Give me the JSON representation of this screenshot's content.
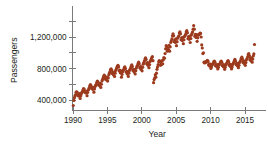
{
  "chart_data": {
    "type": "scatter",
    "title": "",
    "xlabel": "Year",
    "ylabel": "Passengers",
    "xlim": [
      1989.2,
      2016.8
    ],
    "ylim": [
      300000,
      1450000
    ],
    "grid": false,
    "legend": null,
    "marker": {
      "color": "#9c3a1d",
      "shape": "circle",
      "size_px": 2.1
    },
    "axis_color": "#7a7a7a",
    "text_color": "#231f20",
    "background": "#ffffff",
    "xticks": [
      1990,
      1995,
      2000,
      2005,
      2010,
      2015
    ],
    "xtick_labels": [
      "1990",
      "1995",
      "2000",
      "2005",
      "2010",
      "2015"
    ],
    "yticks": [
      400000,
      600000,
      800000,
      1000000,
      1200000,
      1400000
    ],
    "ytick_labels": [
      "400,000",
      "",
      "800,000",
      "",
      "1,200,000",
      ""
    ],
    "ytick_labeled": [
      400000,
      800000,
      1200000
    ],
    "ytick_minor": [
      600000,
      1000000,
      1400000
    ],
    "series": [
      {
        "name": "Monthly passengers",
        "x": [
          1990.04,
          1990.13,
          1990.21,
          1990.29,
          1990.38,
          1990.46,
          1990.54,
          1990.63,
          1990.71,
          1990.79,
          1990.88,
          1990.96,
          1991.04,
          1991.13,
          1991.21,
          1991.29,
          1991.38,
          1991.46,
          1991.54,
          1991.63,
          1991.71,
          1991.79,
          1991.88,
          1991.96,
          1992.04,
          1992.13,
          1992.21,
          1992.29,
          1992.38,
          1992.46,
          1992.54,
          1992.63,
          1992.71,
          1992.79,
          1992.88,
          1992.96,
          1993.04,
          1993.13,
          1993.21,
          1993.29,
          1993.38,
          1993.46,
          1993.54,
          1993.63,
          1993.71,
          1993.79,
          1993.88,
          1993.96,
          1994.04,
          1994.13,
          1994.21,
          1994.29,
          1994.38,
          1994.46,
          1994.54,
          1994.63,
          1994.71,
          1994.79,
          1994.88,
          1994.96,
          1995.04,
          1995.13,
          1995.21,
          1995.29,
          1995.38,
          1995.46,
          1995.54,
          1995.63,
          1995.71,
          1995.79,
          1995.88,
          1995.96,
          1996.04,
          1996.13,
          1996.21,
          1996.29,
          1996.38,
          1996.46,
          1996.54,
          1996.63,
          1996.71,
          1996.79,
          1996.88,
          1996.96,
          1997.04,
          1997.13,
          1997.21,
          1997.29,
          1997.38,
          1997.46,
          1997.54,
          1997.63,
          1997.71,
          1997.79,
          1997.88,
          1997.96,
          1998.04,
          1998.13,
          1998.21,
          1998.29,
          1998.38,
          1998.46,
          1998.54,
          1998.63,
          1998.71,
          1998.79,
          1998.88,
          1998.96,
          1999.04,
          1999.13,
          1999.21,
          1999.29,
          1999.38,
          1999.46,
          1999.54,
          1999.63,
          1999.71,
          1999.79,
          1999.88,
          1999.96,
          2000.04,
          2000.13,
          2000.21,
          2000.29,
          2000.38,
          2000.46,
          2000.54,
          2000.63,
          2000.71,
          2000.79,
          2000.88,
          2000.96,
          2001.04,
          2001.13,
          2001.21,
          2001.29,
          2001.38,
          2001.46,
          2001.54,
          2001.63,
          2001.71,
          2001.79,
          2001.88,
          2001.96,
          2002.04,
          2002.13,
          2002.21,
          2002.29,
          2002.38,
          2002.46,
          2002.54,
          2002.63,
          2002.71,
          2002.79,
          2002.88,
          2002.96,
          2003.04,
          2003.13,
          2003.21,
          2003.29,
          2003.38,
          2003.46,
          2003.54,
          2003.63,
          2003.71,
          2003.79,
          2003.88,
          2003.96,
          2004.04,
          2004.13,
          2004.21,
          2004.29,
          2004.38,
          2004.46,
          2004.54,
          2004.63,
          2004.71,
          2004.79,
          2004.88,
          2004.96,
          2005.04,
          2005.13,
          2005.21,
          2005.29,
          2005.38,
          2005.46,
          2005.54,
          2005.63,
          2005.71,
          2005.79,
          2005.88,
          2005.96,
          2006.04,
          2006.13,
          2006.21,
          2006.29,
          2006.38,
          2006.46,
          2006.54,
          2006.63,
          2006.71,
          2006.79,
          2006.88,
          2006.96,
          2007.04,
          2007.13,
          2007.21,
          2007.29,
          2007.38,
          2007.46,
          2007.54,
          2007.63,
          2007.71,
          2007.79,
          2007.88,
          2007.96,
          2008.04,
          2008.13,
          2008.21,
          2008.29,
          2008.38,
          2008.46,
          2008.54,
          2008.63,
          2008.71,
          2008.79,
          2008.88,
          2008.96,
          2009.04,
          2009.13,
          2009.21,
          2009.29,
          2009.38,
          2009.46,
          2009.54,
          2009.63,
          2009.71,
          2009.79,
          2009.88,
          2009.96,
          2010.04,
          2010.13,
          2010.21,
          2010.29,
          2010.38,
          2010.46,
          2010.54,
          2010.63,
          2010.71,
          2010.79,
          2010.88,
          2010.96,
          2011.04,
          2011.13,
          2011.21,
          2011.29,
          2011.38,
          2011.46,
          2011.54,
          2011.63,
          2011.71,
          2011.79,
          2011.88,
          2011.96,
          2012.04,
          2012.13,
          2012.21,
          2012.29,
          2012.38,
          2012.46,
          2012.54,
          2012.63,
          2012.71,
          2012.79,
          2012.88,
          2012.96,
          2013.04,
          2013.13,
          2013.21,
          2013.29,
          2013.38,
          2013.46,
          2013.54,
          2013.63,
          2013.71,
          2013.79,
          2013.88,
          2013.96,
          2014.04,
          2014.13,
          2014.21,
          2014.29,
          2014.38,
          2014.46,
          2014.54,
          2014.63,
          2014.71,
          2014.79,
          2014.88,
          2014.96,
          2015.04,
          2015.13,
          2015.21,
          2015.29,
          2015.38,
          2015.46,
          2015.54,
          2015.63,
          2015.71,
          2015.79,
          2015.88,
          2015.96,
          2016.04,
          2016.13,
          2016.21,
          2016.29,
          2016.38
        ],
        "y": [
          330000,
          395000,
          430000,
          455000,
          470000,
          500000,
          505000,
          495000,
          455000,
          470000,
          450000,
          480000,
          420000,
          455000,
          480000,
          495000,
          510000,
          530000,
          545000,
          535000,
          500000,
          505000,
          490000,
          510000,
          455000,
          495000,
          525000,
          540000,
          560000,
          585000,
          595000,
          580000,
          545000,
          555000,
          535000,
          560000,
          500000,
          540000,
          570000,
          585000,
          600000,
          625000,
          640000,
          630000,
          590000,
          600000,
          580000,
          610000,
          560000,
          600000,
          640000,
          660000,
          680000,
          700000,
          715000,
          705000,
          665000,
          680000,
          655000,
          690000,
          640000,
          680000,
          720000,
          740000,
          760000,
          785000,
          795000,
          780000,
          735000,
          750000,
          720000,
          755000,
          700000,
          740000,
          775000,
          795000,
          810000,
          830000,
          840000,
          820000,
          770000,
          780000,
          745000,
          770000,
          690000,
          725000,
          760000,
          775000,
          790000,
          810000,
          820000,
          800000,
          755000,
          765000,
          730000,
          760000,
          700000,
          740000,
          775000,
          790000,
          805000,
          830000,
          845000,
          825000,
          775000,
          790000,
          755000,
          785000,
          730000,
          770000,
          805000,
          825000,
          840000,
          865000,
          880000,
          860000,
          810000,
          825000,
          790000,
          820000,
          770000,
          815000,
          855000,
          875000,
          895000,
          920000,
          935000,
          915000,
          860000,
          875000,
          840000,
          870000,
          810000,
          850000,
          890000,
          905000,
          920000,
          940000,
          950000,
          900000,
          620000,
          660000,
          680000,
          720000,
          690000,
          740000,
          790000,
          820000,
          850000,
          885000,
          900000,
          890000,
          840000,
          870000,
          850000,
          900000,
          860000,
          910000,
          940000,
          930000,
          990000,
          1050000,
          1090000,
          1075000,
          1020000,
          1060000,
          1040000,
          1095000,
          1020000,
          1075000,
          1130000,
          1150000,
          1175000,
          1215000,
          1240000,
          1215000,
          1140000,
          1165000,
          1130000,
          1175000,
          1090000,
          1140000,
          1185000,
          1200000,
          1215000,
          1250000,
          1265000,
          1240000,
          1165000,
          1190000,
          1155000,
          1195000,
          1115000,
          1165000,
          1205000,
          1220000,
          1235000,
          1265000,
          1280000,
          1255000,
          1180000,
          1205000,
          1170000,
          1210000,
          1130000,
          1180000,
          1225000,
          1245000,
          1265000,
          1300000,
          1345000,
          1300000,
          1210000,
          1235000,
          1195000,
          1230000,
          1145000,
          1190000,
          1225000,
          1230000,
          1235000,
          1250000,
          1245000,
          1200000,
          1100000,
          1060000,
          990000,
          1000000,
          880000,
          870000,
          880000,
          885000,
          880000,
          895000,
          905000,
          890000,
          845000,
          855000,
          830000,
          855000,
          800000,
          820000,
          845000,
          855000,
          865000,
          885000,
          895000,
          880000,
          835000,
          850000,
          825000,
          850000,
          795000,
          815000,
          845000,
          855000,
          865000,
          885000,
          895000,
          880000,
          835000,
          850000,
          820000,
          845000,
          790000,
          815000,
          845000,
          860000,
          870000,
          890000,
          900000,
          885000,
          840000,
          855000,
          825000,
          850000,
          795000,
          820000,
          850000,
          865000,
          880000,
          900000,
          915000,
          895000,
          850000,
          865000,
          835000,
          865000,
          810000,
          840000,
          875000,
          890000,
          905000,
          930000,
          945000,
          925000,
          875000,
          895000,
          865000,
          895000,
          840000,
          875000,
          910000,
          925000,
          945000,
          975000,
          990000,
          965000,
          910000,
          935000,
          900000,
          935000,
          880000,
          920000,
          960000,
          985000,
          1105000
        ]
      }
    ]
  }
}
